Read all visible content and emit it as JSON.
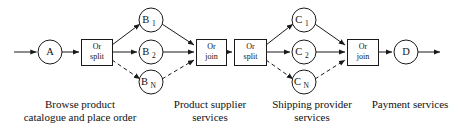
{
  "diagram": {
    "background_color": "#ffffff",
    "stroke_color": "#1a1a1a",
    "nodes": [
      {
        "id": "A",
        "label": "A",
        "sub": "",
        "shape": "circle",
        "cx": 50,
        "cy": 52,
        "r": 12
      },
      {
        "id": "B1",
        "label": "B",
        "sub": "1",
        "shape": "circle",
        "cx": 151,
        "cy": 20,
        "r": 12
      },
      {
        "id": "B2",
        "label": "B",
        "sub": "2",
        "shape": "circle",
        "cx": 151,
        "cy": 52,
        "r": 12
      },
      {
        "id": "BN",
        "label": "B",
        "sub": "N",
        "shape": "circle",
        "cx": 151,
        "cy": 82,
        "r": 12
      },
      {
        "id": "C1",
        "label": "C",
        "sub": "1",
        "shape": "circle",
        "cx": 304,
        "cy": 20,
        "r": 12
      },
      {
        "id": "C2",
        "label": "C",
        "sub": "2",
        "shape": "circle",
        "cx": 304,
        "cy": 52,
        "r": 12
      },
      {
        "id": "CN",
        "label": "C",
        "sub": "N",
        "shape": "circle",
        "cx": 304,
        "cy": 82,
        "r": 12
      },
      {
        "id": "D",
        "label": "D",
        "sub": "",
        "shape": "circle",
        "cx": 406,
        "cy": 52,
        "r": 12
      }
    ],
    "gates": [
      {
        "id": "split1",
        "line1": "Or",
        "line2": "split",
        "x": 81,
        "y": 39,
        "w": 31,
        "h": 26
      },
      {
        "id": "join1",
        "line1": "Or",
        "line2": "join",
        "x": 196,
        "y": 39,
        "w": 30,
        "h": 26
      },
      {
        "id": "split2",
        "line1": "Or",
        "line2": "split",
        "x": 234,
        "y": 39,
        "w": 32,
        "h": 26
      },
      {
        "id": "join2",
        "line1": "Or",
        "line2": "join",
        "x": 347,
        "y": 39,
        "w": 31,
        "h": 26
      }
    ],
    "edges": [
      {
        "from": "start",
        "to": "A",
        "style": "solid"
      },
      {
        "from": "A",
        "to": "split1",
        "style": "solid"
      },
      {
        "from": "split1",
        "to": "B1",
        "style": "solid"
      },
      {
        "from": "split1",
        "to": "B2",
        "style": "solid"
      },
      {
        "from": "split1",
        "to": "BN",
        "style": "dashed"
      },
      {
        "from": "B1",
        "to": "join1",
        "style": "solid"
      },
      {
        "from": "B2",
        "to": "join1",
        "style": "solid"
      },
      {
        "from": "BN",
        "to": "join1",
        "style": "dashed"
      },
      {
        "from": "join1",
        "to": "split2",
        "style": "solid"
      },
      {
        "from": "split2",
        "to": "C1",
        "style": "solid"
      },
      {
        "from": "split2",
        "to": "C2",
        "style": "solid"
      },
      {
        "from": "split2",
        "to": "CN",
        "style": "dashed"
      },
      {
        "from": "C1",
        "to": "join2",
        "style": "solid"
      },
      {
        "from": "C2",
        "to": "join2",
        "style": "solid"
      },
      {
        "from": "CN",
        "to": "join2",
        "style": "dashed"
      },
      {
        "from": "join2",
        "to": "D",
        "style": "solid"
      },
      {
        "from": "D",
        "to": "end",
        "style": "solid"
      }
    ],
    "captions": [
      {
        "id": "caption-browse",
        "text": "Browse product\ncatalogue and place order",
        "left": 0,
        "top": 98,
        "width": 160
      },
      {
        "id": "caption-supplier",
        "text": "Product supplier\nservices",
        "left": 150,
        "top": 98,
        "width": 120
      },
      {
        "id": "caption-shipping",
        "text": "Shipping provider\nservices",
        "left": 252,
        "top": 98,
        "width": 120
      },
      {
        "id": "caption-payment",
        "text": "Payment services",
        "left": 362,
        "top": 98,
        "width": 96
      }
    ]
  }
}
